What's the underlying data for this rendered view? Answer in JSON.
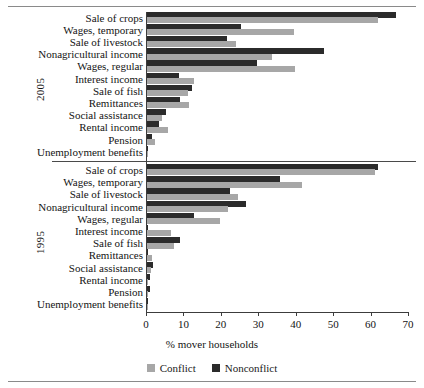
{
  "figure": {
    "axis_title": "% mover households",
    "group_labels": [
      "2005",
      "1995"
    ],
    "legend": [
      {
        "label": "Conflict",
        "color": "#a7a7a7",
        "key": "conflict"
      },
      {
        "label": "Nonconflict",
        "color": "#2b2b2b",
        "key": "nonconflict"
      }
    ]
  },
  "chart_data": {
    "type": "bar",
    "orientation": "horizontal",
    "title": "",
    "xlabel": "% mover households",
    "ylabel": "",
    "xlim": [
      0,
      70
    ],
    "xticks": [
      0,
      10,
      20,
      30,
      40,
      50,
      60,
      70
    ],
    "grid": false,
    "legend_position": "bottom-center",
    "legend_entries": [
      "Conflict",
      "Nonconflict"
    ],
    "panels": [
      {
        "name": "2005",
        "categories": [
          "Sale of crops",
          "Wages, temporary",
          "Sale of livestock",
          "Nonagricultural income",
          "Wages, regular",
          "Interest income",
          "Sale of fish",
          "Remittances",
          "Social assistance",
          "Rental income",
          "Pension",
          "Unemployment benefits"
        ],
        "series": [
          {
            "name": "Conflict",
            "color": "#a7a7a7",
            "values": [
              61.6,
              39.3,
              23.7,
              33.5,
              39.6,
              12.5,
              11.0,
              11.2,
              4.0,
              5.6,
              2.2,
              0.3
            ]
          },
          {
            "name": "Nonconflict",
            "color": "#2b2b2b",
            "values": [
              66.5,
              25.0,
              21.4,
              47.2,
              29.5,
              8.5,
              11.9,
              8.9,
              5.1,
              3.1,
              1.3,
              0.2
            ]
          }
        ]
      },
      {
        "name": "1995",
        "categories": [
          "Sale of crops",
          "Wages, temporary",
          "Sale of livestock",
          "Nonagricultural income",
          "Wages, regular",
          "Interest income",
          "Sale of fish",
          "Remittances",
          "Social assistance",
          "Rental income",
          "Pension",
          "Unemployment benefits"
        ],
        "series": [
          {
            "name": "Conflict",
            "color": "#a7a7a7",
            "values": [
              60.9,
              41.4,
              24.3,
              21.7,
              19.5,
              6.4,
              7.2,
              1.3,
              1.1,
              0.3,
              0.2,
              0.1
            ]
          },
          {
            "name": "Nonconflict",
            "color": "#2b2b2b",
            "values": [
              61.7,
              35.6,
              22.3,
              26.5,
              12.5,
              0.2,
              8.9,
              0.2,
              1.6,
              0.9,
              0.7,
              0.1
            ]
          }
        ]
      }
    ]
  }
}
